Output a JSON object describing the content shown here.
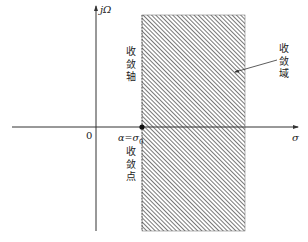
{
  "diagram": {
    "title": "",
    "axes": {
      "vertical_label": "jΩ",
      "horizontal_label": "σ",
      "origin_label": "0"
    },
    "point_label": "α=σ",
    "point_label_sub": "0",
    "convergence_axis_label": [
      "收",
      "敛",
      "轴"
    ],
    "convergence_point_label": [
      "收",
      "敛",
      "点"
    ],
    "convergence_region_label": [
      "收",
      "敛",
      "域"
    ],
    "colors": {
      "axis": "#333333",
      "hatch": "#555555",
      "background": "#ffffff"
    }
  }
}
